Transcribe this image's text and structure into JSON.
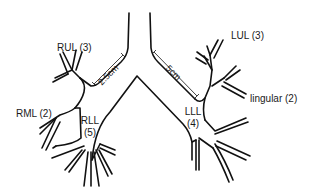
{
  "diagram": {
    "stroke_color": "#111111",
    "background": "#ffffff",
    "labels": {
      "rul": "RUL (3)",
      "rml": "RML (2)",
      "rll_name": "RLL",
      "rll_count": "(5)",
      "lul": "LUL (3)",
      "lingular": "lingular (2)",
      "lll_name": "LLL",
      "lll_count": "(4)"
    },
    "measurements": {
      "right_main_bronchus": "2.5cm",
      "left_main_bronchus": "5cm"
    }
  }
}
